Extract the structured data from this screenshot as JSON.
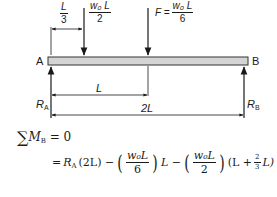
{
  "diagram": {
    "type": "simply-supported-beam",
    "beam_color": "#d4d4d4",
    "beam_border": "#333333",
    "labels": {
      "left_end": "A",
      "right_end": "B",
      "reaction_left": "R",
      "reaction_left_sub": "A",
      "reaction_right": "R",
      "reaction_right_sub": "B"
    },
    "dimensions": {
      "load1_offset_num": "L",
      "load1_offset_den": "3",
      "half_span": "L",
      "full_span": "2L"
    },
    "loads": [
      {
        "name": "load-1",
        "num": "w₀ L",
        "den": "2",
        "prefix": ""
      },
      {
        "name": "load-f",
        "prefix": "F =",
        "num": "w₀ L",
        "den": "6"
      }
    ]
  },
  "equations": {
    "line1": {
      "sum": "∑",
      "M": "M",
      "M_sub": "B",
      "rhs": "= 0"
    },
    "line2": {
      "eq": "=",
      "ra": "R",
      "ra_sub": "A",
      "ra_arg": "(2L) −",
      "t1_num": "w₀L",
      "t1_den": "6",
      "t1_after": "L −",
      "t2_num": "w₀L",
      "t2_den": "2",
      "t2_after_open": "(L +",
      "t2_frac_num": "2",
      "t2_frac_den": "3",
      "t2_after_close": "L)"
    }
  }
}
